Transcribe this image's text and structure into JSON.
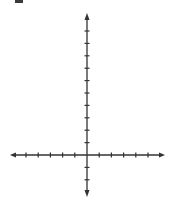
{
  "diagram": {
    "type": "coordinate-plane",
    "x_axis": {
      "ticks_negative": 5,
      "ticks_positive": 5,
      "arrows": "both"
    },
    "y_axis": {
      "ticks_positive": 10,
      "ticks_negative": 2,
      "arrows": "both"
    },
    "colors": {
      "axis": "#333333",
      "background": "#ffffff"
    }
  },
  "chart_data": {
    "type": "line",
    "title": "",
    "xlabel": "",
    "ylabel": "",
    "xlim": [
      -6,
      6
    ],
    "ylim": [
      -3,
      11
    ],
    "series": [],
    "grid": false,
    "x_ticks": [
      -5,
      -4,
      -3,
      -2,
      -1,
      1,
      2,
      3,
      4,
      5
    ],
    "y_ticks": [
      -2,
      -1,
      1,
      2,
      3,
      4,
      5,
      6,
      7,
      8,
      9,
      10
    ]
  }
}
